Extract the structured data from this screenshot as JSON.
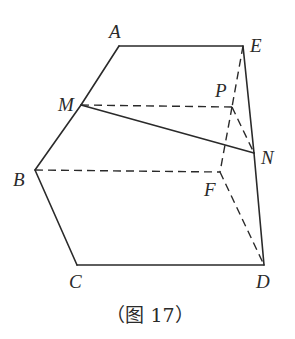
{
  "figure": {
    "caption": "（图 17）",
    "points": {
      "A": {
        "label": "A",
        "x": 119,
        "y": 46
      },
      "E": {
        "label": "E",
        "x": 243,
        "y": 46
      },
      "M": {
        "label": "M",
        "x": 81,
        "y": 105
      },
      "P": {
        "label": "P",
        "x": 232,
        "y": 107
      },
      "N": {
        "label": "N",
        "x": 254,
        "y": 153
      },
      "B": {
        "label": "B",
        "x": 35,
        "y": 170
      },
      "F": {
        "label": "F",
        "x": 220,
        "y": 172
      },
      "C": {
        "label": "C",
        "x": 77,
        "y": 265
      },
      "D": {
        "label": "D",
        "x": 264,
        "y": 265
      }
    },
    "solid_edges": [
      [
        "A",
        "E"
      ],
      [
        "A",
        "M"
      ],
      [
        "M",
        "B"
      ],
      [
        "B",
        "C"
      ],
      [
        "C",
        "D"
      ],
      [
        "E",
        "N"
      ],
      [
        "N",
        "D"
      ],
      [
        "M",
        "N"
      ]
    ],
    "dashed_edges": [
      [
        "M",
        "P"
      ],
      [
        "B",
        "F"
      ],
      [
        "E",
        "P"
      ],
      [
        "P",
        "F"
      ],
      [
        "P",
        "N"
      ],
      [
        "F",
        "D"
      ]
    ],
    "colors": {
      "stroke": "#2a2a2a",
      "background": "#ffffff"
    }
  }
}
